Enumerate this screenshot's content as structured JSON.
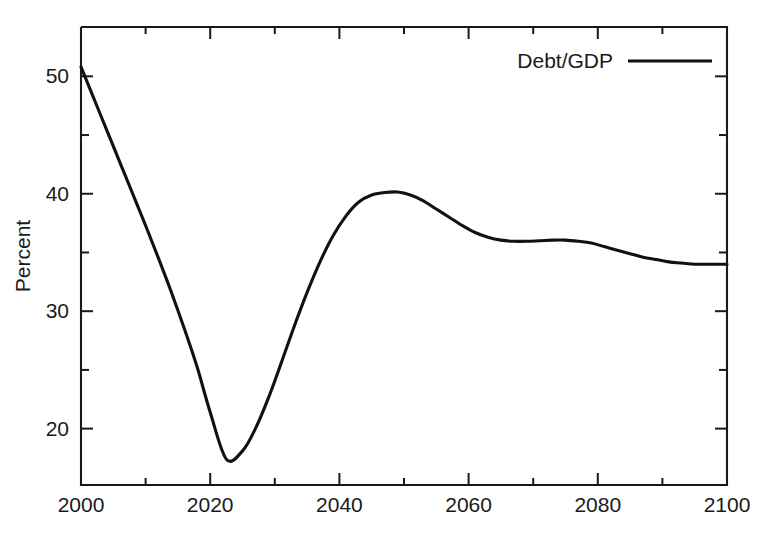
{
  "chart_data": {
    "type": "line",
    "title": "",
    "subtitle": "",
    "xlabel": "",
    "ylabel": "Percent",
    "xlim": [
      2000,
      2100
    ],
    "ylim": [
      15.2,
      54.2
    ],
    "grid": false,
    "legend_position": "top-right",
    "x_ticks": [
      2000,
      2020,
      2040,
      2060,
      2080,
      2100
    ],
    "x_tick_labels": [
      "2000",
      "2020",
      "2040",
      "2060",
      "2080",
      "2100"
    ],
    "x_minor_ticks": [
      2010,
      2030,
      2050,
      2070,
      2090
    ],
    "y_ticks": [
      20,
      30,
      40,
      50
    ],
    "y_tick_labels": [
      "20",
      "30",
      "40",
      "50"
    ],
    "y_minor_ticks": [
      25,
      35,
      45
    ],
    "series": [
      {
        "name": "Debt/GDP",
        "color": "#111111",
        "x": [
          2000,
          2002,
          2004,
          2006,
          2008,
          2010,
          2012,
          2014,
          2016,
          2018,
          2020,
          2022.5,
          2025,
          2027,
          2029,
          2031,
          2033,
          2035,
          2037,
          2039,
          2041,
          2043,
          2045,
          2047,
          2049,
          2051,
          2053,
          2055,
          2057,
          2059,
          2061,
          2063,
          2065,
          2067,
          2069,
          2071,
          2073,
          2075,
          2077,
          2079,
          2081,
          2083,
          2085,
          2087,
          2089,
          2091,
          2093,
          2095,
          2097,
          2100
        ],
        "values": [
          50.8,
          48.1,
          45.4,
          42.7,
          40.0,
          37.3,
          34.5,
          31.6,
          28.5,
          25.2,
          21.4,
          17.4,
          18.1,
          20.0,
          22.6,
          25.6,
          28.7,
          31.6,
          34.2,
          36.4,
          38.1,
          39.3,
          39.9,
          40.1,
          40.15,
          39.9,
          39.4,
          38.7,
          38.0,
          37.3,
          36.7,
          36.3,
          36.05,
          35.95,
          35.95,
          36.0,
          36.05,
          36.05,
          35.95,
          35.8,
          35.5,
          35.2,
          34.9,
          34.6,
          34.4,
          34.2,
          34.1,
          34.0,
          34.0,
          34.0
        ]
      }
    ],
    "annotations": [],
    "legend": [
      {
        "label": "Debt/GDP",
        "color": "#111111",
        "style": "solid-line"
      }
    ]
  },
  "legend": {
    "entry_label": "Debt/GDP"
  },
  "axes": {
    "y_title": "Percent"
  }
}
